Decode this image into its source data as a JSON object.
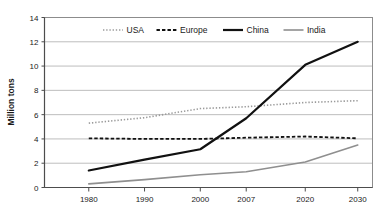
{
  "chart_data": {
    "type": "line",
    "title": "",
    "xlabel": "",
    "ylabel": "Million tons",
    "x": [
      "1980",
      "1990",
      "2000",
      "2007",
      "2020",
      "2030"
    ],
    "categories": [
      "1980",
      "1990",
      "2000",
      "2007",
      "2020",
      "2030"
    ],
    "ylim": [
      0,
      14
    ],
    "yticks": [
      "0",
      "2",
      "4",
      "6",
      "8",
      "10",
      "12",
      "14"
    ],
    "grid": "horizontal",
    "legend_position": "top-center",
    "series": [
      {
        "name": "USA",
        "values": [
          5.3,
          5.75,
          6.5,
          6.65,
          7.0,
          7.15
        ],
        "style": "dotted",
        "color": "#9a9a9a",
        "width": 1.6
      },
      {
        "name": "Europe",
        "values": [
          4.05,
          4.0,
          4.0,
          4.1,
          4.2,
          4.05
        ],
        "style": "dashed",
        "color": "#111111",
        "width": 1.8
      },
      {
        "name": "China",
        "values": [
          1.4,
          2.3,
          3.15,
          5.7,
          10.1,
          12.0
        ],
        "style": "solid",
        "color": "#111111",
        "width": 2.2
      },
      {
        "name": "India",
        "values": [
          0.3,
          0.65,
          1.05,
          1.3,
          2.1,
          3.5
        ],
        "style": "solid",
        "color": "#8f8f8f",
        "width": 1.6
      }
    ]
  },
  "legend": {
    "items": [
      {
        "label": "USA"
      },
      {
        "label": "Europe"
      },
      {
        "label": "China"
      },
      {
        "label": "India"
      }
    ]
  },
  "colors": {
    "grid": "#b5b5b5",
    "frame": "#8c8c8c",
    "axis": "#4d4d4d",
    "text": "#1a1a1a",
    "background": "#ffffff"
  }
}
